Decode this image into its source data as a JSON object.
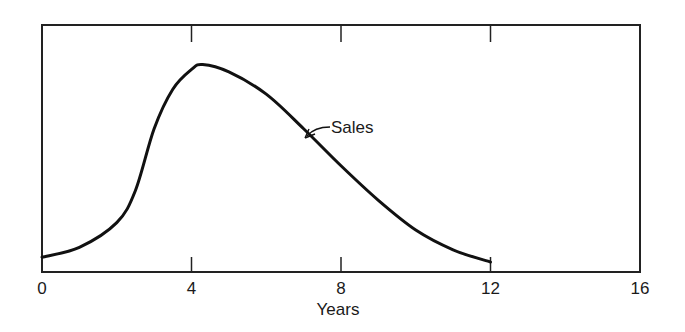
{
  "chart_data": {
    "type": "line",
    "title": "",
    "xlabel": "Years",
    "ylabel": "",
    "xlim": [
      0,
      16
    ],
    "ylim": [
      0,
      100
    ],
    "x_ticks": [
      0,
      4,
      8,
      12,
      16
    ],
    "x_tick_labels": [
      "0",
      "4",
      "8",
      "12",
      "16"
    ],
    "y_ticks": [],
    "grid": false,
    "legend": null,
    "series": [
      {
        "name": "Sales",
        "x": [
          0,
          1,
          2,
          2.5,
          3,
          3.5,
          4,
          4.3,
          5,
          6,
          7,
          8,
          9,
          10,
          11,
          12
        ],
        "values": [
          6,
          10,
          20,
          33,
          58,
          74,
          82,
          84,
          81,
          72,
          58,
          43,
          29,
          17,
          9,
          4
        ]
      }
    ],
    "annotations": [
      {
        "text": "Sales",
        "x": 7.6,
        "y": 60,
        "arrow_to": {
          "x": 7.0,
          "y": 58
        }
      }
    ]
  },
  "labels": {
    "xlabel": "Years",
    "series_label": "Sales",
    "ticks": [
      "0",
      "4",
      "8",
      "12",
      "16"
    ]
  },
  "colors": {
    "line": "#111111",
    "frame": "#222222",
    "background": "#ffffff"
  }
}
